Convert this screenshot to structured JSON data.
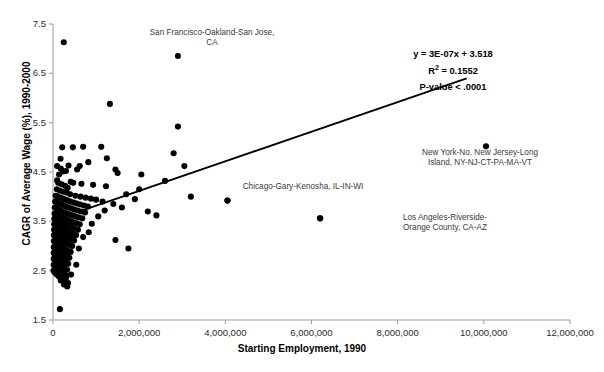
{
  "chart_data": {
    "type": "scatter",
    "title": "",
    "xlabel": "Starting Employment, 1990",
    "ylabel": "CAGR of Average Wage (%), 1990-2000",
    "xlim": [
      0,
      12000000
    ],
    "ylim": [
      1.5,
      7.5
    ],
    "xticks": [
      0,
      2000000,
      4000000,
      6000000,
      8000000,
      10000000,
      12000000
    ],
    "xtick_labels": [
      "0",
      "2,000,000",
      "4,000,000",
      "6,000,000",
      "8,000,000",
      "10,000,000",
      "12,000,000"
    ],
    "yticks": [
      1.5,
      2.5,
      3.5,
      4.5,
      5.5,
      6.5,
      7.5
    ],
    "ytick_labels": [
      "1.5",
      "2.5",
      "3.5",
      "4.5",
      "5.5",
      "6.5",
      "7.5"
    ],
    "grid": false,
    "legend": false,
    "marker_color": "#000000",
    "marker_size": 4.1,
    "trendline": {
      "equation": "y = 3E-07x + 3.518",
      "slope": 3e-07,
      "intercept": 3.518,
      "x_start": 700000,
      "x_end": 9600000,
      "color": "#000000",
      "width": 1.9
    },
    "statistics": {
      "equation_label": "y = 3E-07x + 3.518",
      "r_squared_label": "R2 = 0.1552",
      "r_squared_value": 0.1552,
      "p_value_label": "P-value < .0001"
    },
    "annotations": [
      {
        "text": "San Francisco-Oakland-San Jose, CA",
        "point_x": 2900000,
        "point_y": 6.85,
        "label_left": 148,
        "label_top": 28,
        "label_width": 128,
        "has_dot_marker": false
      },
      {
        "text": "New York-No. New Jersey-Long Island, NY-NJ-CT-PA-MA-VT",
        "point_x": 10050000,
        "point_y": 5.02,
        "label_left": 418,
        "label_top": 148,
        "label_width": 124,
        "has_dot_marker": false
      },
      {
        "text": "Chicago-Gary-Kenosha, IL-IN-WI",
        "point_x": 4050000,
        "point_y": 3.92,
        "label_left": 228,
        "label_top": 182,
        "label_width": 150,
        "has_dot_marker": true
      },
      {
        "text": "Los Angeles-Riverside-Orange County, CA-AZ",
        "point_x": 6200000,
        "point_y": 3.56,
        "label_left": 390,
        "label_top": 213,
        "label_width": 110,
        "has_dot_marker": true
      }
    ],
    "points": [
      [
        250000,
        7.13
      ],
      [
        1320000,
        5.88
      ],
      [
        2900000,
        6.85
      ],
      [
        2900000,
        5.42
      ],
      [
        1120000,
        5.01
      ],
      [
        460000,
        5.0
      ],
      [
        215000,
        5.0
      ],
      [
        700000,
        5.01
      ],
      [
        2800000,
        4.88
      ],
      [
        175000,
        4.77
      ],
      [
        820000,
        4.7
      ],
      [
        180000,
        4.57
      ],
      [
        360000,
        4.63
      ],
      [
        620000,
        4.62
      ],
      [
        560000,
        4.55
      ],
      [
        300000,
        4.52
      ],
      [
        1450000,
        4.55
      ],
      [
        1500000,
        4.48
      ],
      [
        2600000,
        4.32
      ],
      [
        2000000,
        4.15
      ],
      [
        230000,
        4.51
      ],
      [
        140000,
        4.45
      ],
      [
        95000,
        4.33
      ],
      [
        410000,
        4.3
      ],
      [
        470000,
        4.28
      ],
      [
        660000,
        4.26
      ],
      [
        930000,
        4.24
      ],
      [
        1230000,
        4.21
      ],
      [
        1700000,
        4.05
      ],
      [
        4050000,
        3.92
      ],
      [
        3200000,
        4.0
      ],
      [
        120000,
        4.28
      ],
      [
        200000,
        4.25
      ],
      [
        280000,
        4.22
      ],
      [
        340000,
        4.18
      ],
      [
        90000,
        4.15
      ],
      [
        160000,
        4.12
      ],
      [
        240000,
        4.1
      ],
      [
        320000,
        4.08
      ],
      [
        400000,
        4.05
      ],
      [
        520000,
        4.02
      ],
      [
        640000,
        4.0
      ],
      [
        760000,
        3.98
      ],
      [
        880000,
        3.96
      ],
      [
        1000000,
        3.94
      ],
      [
        1150000,
        3.9
      ],
      [
        60000,
        4.02
      ],
      [
        110000,
        4.0
      ],
      [
        170000,
        3.98
      ],
      [
        225000,
        3.96
      ],
      [
        285000,
        3.94
      ],
      [
        345000,
        3.92
      ],
      [
        405000,
        3.9
      ],
      [
        480000,
        3.88
      ],
      [
        555000,
        3.86
      ],
      [
        630000,
        3.84
      ],
      [
        720000,
        3.82
      ],
      [
        810000,
        3.8
      ],
      [
        50000,
        3.9
      ],
      [
        100000,
        3.88
      ],
      [
        150000,
        3.86
      ],
      [
        200000,
        3.84
      ],
      [
        255000,
        3.82
      ],
      [
        310000,
        3.8
      ],
      [
        370000,
        3.78
      ],
      [
        430000,
        3.76
      ],
      [
        495000,
        3.74
      ],
      [
        570000,
        3.72
      ],
      [
        650000,
        3.7
      ],
      [
        745000,
        3.68
      ],
      [
        40000,
        3.78
      ],
      [
        85000,
        3.76
      ],
      [
        130000,
        3.74
      ],
      [
        180000,
        3.72
      ],
      [
        230000,
        3.7
      ],
      [
        280000,
        3.68
      ],
      [
        335000,
        3.66
      ],
      [
        390000,
        3.64
      ],
      [
        450000,
        3.62
      ],
      [
        515000,
        3.6
      ],
      [
        590000,
        3.58
      ],
      [
        680000,
        3.56
      ],
      [
        35000,
        3.66
      ],
      [
        75000,
        3.64
      ],
      [
        120000,
        3.62
      ],
      [
        165000,
        3.6
      ],
      [
        210000,
        3.58
      ],
      [
        258000,
        3.56
      ],
      [
        305000,
        3.54
      ],
      [
        355000,
        3.52
      ],
      [
        410000,
        3.5
      ],
      [
        470000,
        3.48
      ],
      [
        540000,
        3.46
      ],
      [
        620000,
        3.44
      ],
      [
        30000,
        3.55
      ],
      [
        70000,
        3.53
      ],
      [
        110000,
        3.51
      ],
      [
        152000,
        3.49
      ],
      [
        195000,
        3.47
      ],
      [
        240000,
        3.45
      ],
      [
        288000,
        3.43
      ],
      [
        336000,
        3.41
      ],
      [
        388000,
        3.39
      ],
      [
        444000,
        3.37
      ],
      [
        508000,
        3.35
      ],
      [
        580000,
        3.33
      ],
      [
        28000,
        3.44
      ],
      [
        64000,
        3.42
      ],
      [
        102000,
        3.4
      ],
      [
        140000,
        3.38
      ],
      [
        180000,
        3.36
      ],
      [
        222000,
        3.34
      ],
      [
        265000,
        3.32
      ],
      [
        310000,
        3.3
      ],
      [
        358000,
        3.28
      ],
      [
        410000,
        3.26
      ],
      [
        468000,
        3.24
      ],
      [
        534000,
        3.22
      ],
      [
        25000,
        3.33
      ],
      [
        58000,
        3.31
      ],
      [
        93000,
        3.29
      ],
      [
        128000,
        3.27
      ],
      [
        165000,
        3.25
      ],
      [
        203000,
        3.23
      ],
      [
        243000,
        3.21
      ],
      [
        285000,
        3.19
      ],
      [
        329000,
        3.17
      ],
      [
        377000,
        3.15
      ],
      [
        430000,
        3.13
      ],
      [
        490000,
        3.11
      ],
      [
        22000,
        3.22
      ],
      [
        52000,
        3.2
      ],
      [
        84000,
        3.18
      ],
      [
        116000,
        3.16
      ],
      [
        150000,
        3.14
      ],
      [
        185000,
        3.12
      ],
      [
        221000,
        3.1
      ],
      [
        259000,
        3.08
      ],
      [
        299000,
        3.06
      ],
      [
        343000,
        3.04
      ],
      [
        391000,
        3.02
      ],
      [
        446000,
        3.0
      ],
      [
        20000,
        3.1
      ],
      [
        48000,
        3.08
      ],
      [
        77000,
        3.06
      ],
      [
        107000,
        3.04
      ],
      [
        138000,
        3.02
      ],
      [
        170000,
        3.0
      ],
      [
        204000,
        2.98
      ],
      [
        239000,
        2.96
      ],
      [
        276000,
        2.94
      ],
      [
        316000,
        2.92
      ],
      [
        360000,
        2.9
      ],
      [
        410000,
        2.88
      ],
      [
        18000,
        2.98
      ],
      [
        44000,
        2.96
      ],
      [
        71000,
        2.94
      ],
      [
        99000,
        2.92
      ],
      [
        128000,
        2.9
      ],
      [
        158000,
        2.88
      ],
      [
        189000,
        2.86
      ],
      [
        222000,
        2.84
      ],
      [
        256000,
        2.82
      ],
      [
        293000,
        2.8
      ],
      [
        334000,
        2.78
      ],
      [
        380000,
        2.76
      ],
      [
        16000,
        2.86
      ],
      [
        40000,
        2.84
      ],
      [
        65000,
        2.82
      ],
      [
        91000,
        2.8
      ],
      [
        118000,
        2.78
      ],
      [
        146000,
        2.76
      ],
      [
        175000,
        2.74
      ],
      [
        205000,
        2.72
      ],
      [
        237000,
        2.7
      ],
      [
        271000,
        2.68
      ],
      [
        309000,
        2.66
      ],
      [
        352000,
        2.64
      ],
      [
        15000,
        2.74
      ],
      [
        37000,
        2.72
      ],
      [
        60000,
        2.7
      ],
      [
        84000,
        2.68
      ],
      [
        109000,
        2.66
      ],
      [
        135000,
        2.64
      ],
      [
        162000,
        2.62
      ],
      [
        190000,
        2.6
      ],
      [
        220000,
        2.58
      ],
      [
        252000,
        2.56
      ],
      [
        287000,
        2.54
      ],
      [
        327000,
        2.52
      ],
      [
        14000,
        2.62
      ],
      [
        34000,
        2.6
      ],
      [
        56000,
        2.58
      ],
      [
        78000,
        2.56
      ],
      [
        101000,
        2.54
      ],
      [
        125000,
        2.52
      ],
      [
        150000,
        2.5
      ],
      [
        176000,
        2.48
      ],
      [
        204000,
        2.46
      ],
      [
        234000,
        2.44
      ],
      [
        266000,
        2.42
      ],
      [
        303000,
        2.4
      ],
      [
        13000,
        2.5
      ],
      [
        32000,
        2.48
      ],
      [
        52000,
        2.46
      ],
      [
        73000,
        2.44
      ],
      [
        95000,
        2.42
      ],
      [
        117000,
        2.4
      ],
      [
        141000,
        2.38
      ],
      [
        166000,
        2.36
      ],
      [
        192000,
        2.34
      ],
      [
        220000,
        2.32
      ],
      [
        250000,
        2.3
      ],
      [
        180000,
        2.3
      ],
      [
        300000,
        2.35
      ],
      [
        420000,
        2.42
      ],
      [
        350000,
        2.25
      ],
      [
        540000,
        2.62
      ],
      [
        600000,
        2.95
      ],
      [
        700000,
        3.18
      ],
      [
        830000,
        3.28
      ],
      [
        900000,
        3.45
      ],
      [
        1050000,
        3.6
      ],
      [
        1200000,
        3.72
      ],
      [
        1400000,
        3.85
      ],
      [
        1600000,
        3.78
      ],
      [
        1900000,
        3.95
      ],
      [
        2200000,
        3.7
      ],
      [
        2400000,
        3.62
      ],
      [
        1750000,
        2.95
      ],
      [
        1450000,
        3.12
      ],
      [
        6200000,
        3.56
      ],
      [
        10050000,
        5.02
      ],
      [
        160000,
        1.72
      ],
      [
        330000,
        2.18
      ],
      [
        255000,
        2.22
      ],
      [
        95000,
        4.62
      ],
      [
        1250000,
        4.78
      ],
      [
        2050000,
        4.45
      ],
      [
        3050000,
        4.62
      ]
    ]
  },
  "figure": {
    "caption": ""
  }
}
